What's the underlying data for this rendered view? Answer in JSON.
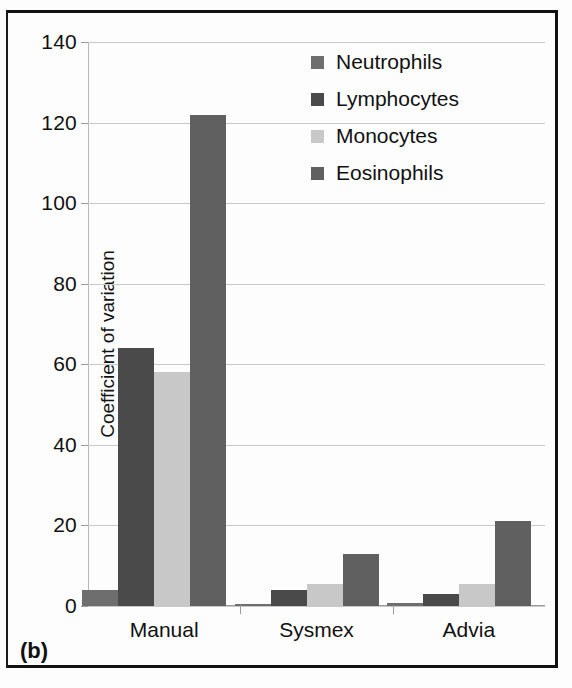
{
  "figure": {
    "caption": "(b)"
  },
  "legend": {
    "position": "top-center-right",
    "items": [
      {
        "label": "Neutrophils",
        "color": "#6e6e6e"
      },
      {
        "label": "Lymphocytes",
        "color": "#4a4a4a"
      },
      {
        "label": "Monocytes",
        "color": "#c8c8c8"
      },
      {
        "label": "Eosinophils",
        "color": "#606060"
      }
    ]
  },
  "axes": {
    "ylabel": "Coefficient of variation",
    "yticks": [
      "0",
      "20",
      "40",
      "60",
      "80",
      "100",
      "120",
      "140"
    ],
    "xticks": [
      "Manual",
      "Sysmex",
      "Advia"
    ]
  },
  "chart_data": {
    "type": "bar",
    "title": "",
    "xlabel": "",
    "ylabel": "Coefficient of variation",
    "categories": [
      "Manual",
      "Sysmex",
      "Advia"
    ],
    "series": [
      {
        "name": "Neutrophils",
        "color": "#6e6e6e",
        "values": [
          4,
          0.4,
          0.8
        ]
      },
      {
        "name": "Lymphocytes",
        "color": "#4a4a4a",
        "values": [
          64,
          4,
          3
        ]
      },
      {
        "name": "Monocytes",
        "color": "#c8c8c8",
        "values": [
          58,
          5.5,
          5.5
        ]
      },
      {
        "name": "Eosinophils",
        "color": "#606060",
        "values": [
          122,
          13,
          21
        ]
      }
    ],
    "ylim": [
      0,
      140
    ],
    "ytick_step": 20,
    "grid": true,
    "legend_position": "upper center"
  }
}
